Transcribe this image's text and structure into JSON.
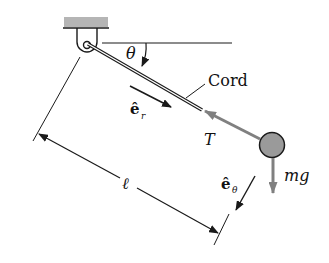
{
  "diagram": {
    "labels": {
      "angle": "θ",
      "cord": "Cord",
      "unit_r": "ê",
      "unit_r_sub": "r",
      "tension": "T",
      "unit_theta": "ê",
      "unit_theta_sub": "θ",
      "weight": "mg",
      "length": "ℓ"
    },
    "colors": {
      "ink": "#1a1a1a",
      "force_gray": "#808080",
      "ball_fill": "#9a9a9a",
      "ceiling_fill": "#b5b5b5"
    }
  }
}
